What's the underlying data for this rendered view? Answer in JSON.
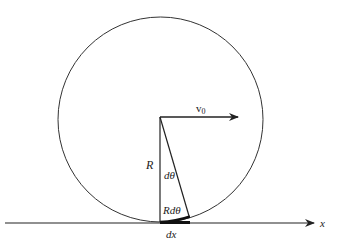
{
  "diagram": {
    "type": "rolling-wheel",
    "labels": {
      "velocity": "v",
      "velocity_subscript": "0",
      "radius": "R",
      "angle": "dθ",
      "arc": "Rdθ",
      "displacement": "dx",
      "axis": "x"
    },
    "geometry": {
      "circle_center": [
        160.5,
        119.5
      ],
      "circle_radius": 102.5,
      "ground_y": 223,
      "ground_x_start": 5,
      "ground_x_end": 315,
      "velocity_arrow": {
        "from": [
          160,
          117
        ],
        "to": [
          238,
          117
        ]
      },
      "radius_line": {
        "from": [
          160,
          117
        ],
        "to": [
          160,
          222
        ]
      },
      "slant_line": {
        "from": [
          160,
          117
        ],
        "to": [
          189,
          216
        ]
      }
    },
    "colors": {
      "stroke": "#222222",
      "background": "#ffffff"
    }
  }
}
